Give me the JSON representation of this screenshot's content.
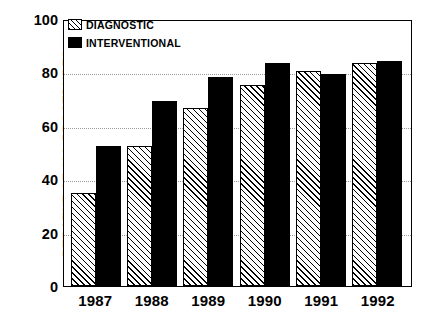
{
  "chart_data": {
    "type": "bar",
    "title": "",
    "xlabel": "",
    "ylabel": "PERCENT OF ALL PROCEDURES",
    "ylim": [
      0,
      100
    ],
    "yticks": [
      0,
      20,
      40,
      60,
      80,
      100
    ],
    "ytick_labels": [
      "0",
      "20",
      "40",
      "60",
      "80",
      "100"
    ],
    "grid": "horizontal-dotted",
    "legend_position": "top-left-inside",
    "categories": [
      "1987",
      "1988",
      "1989",
      "1990",
      "1991",
      "1992"
    ],
    "series": [
      {
        "name": "DIAGNOSTIC",
        "fill": "diagonal-hatch",
        "color": "#ffffff",
        "edge_color": "#000000",
        "values": [
          35,
          53,
          67,
          76,
          81,
          84
        ]
      },
      {
        "name": "INTERVENTIONAL",
        "fill": "solid",
        "color": "#000000",
        "edge_color": "#000000",
        "values": [
          53,
          70,
          79,
          84,
          80,
          85
        ]
      }
    ]
  },
  "legend": {
    "items": [
      {
        "label": "DIAGNOSTIC",
        "swatch": "hatch-swatch-icon"
      },
      {
        "label": "INTERVENTIONAL",
        "swatch": "solid-swatch-icon"
      }
    ]
  }
}
